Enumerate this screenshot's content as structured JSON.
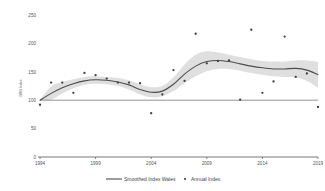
{
  "chart_data": {
    "type": "line",
    "title": "",
    "subtitle": "",
    "xlabel": "",
    "ylabel": "BRB Index",
    "xlim": [
      1994,
      2019
    ],
    "ylim": [
      0,
      250
    ],
    "grid": false,
    "legend_position": "bottom",
    "x_ticks": [
      "1994",
      "1999",
      "2004",
      "2009",
      "2014",
      "2019"
    ],
    "x_tick_values": [
      1994,
      1999,
      2004,
      2009,
      2014,
      2019
    ],
    "y_ticks": [
      "0",
      "50",
      "100",
      "150",
      "200",
      "250"
    ],
    "y_tick_values": [
      0,
      50,
      100,
      150,
      200,
      250
    ],
    "reference_line": {
      "label": "Baseline 100",
      "value": 100
    },
    "x": [
      1994,
      1995,
      1996,
      1997,
      1998,
      1999,
      2000,
      2001,
      2002,
      2003,
      2004,
      2005,
      2006,
      2007,
      2008,
      2009,
      2010,
      2011,
      2012,
      2013,
      2014,
      2015,
      2016,
      2017,
      2018,
      2019
    ],
    "series": [
      {
        "name": "Smoothed Index Wales",
        "type": "line",
        "color": "#4d4d4d",
        "values": [
          100,
          112,
          122,
          129,
          134,
          136,
          135,
          132,
          127,
          119,
          114,
          116,
          128,
          146,
          160,
          168,
          170,
          168,
          164,
          160,
          157,
          155,
          155,
          156,
          153,
          145
        ]
      },
      {
        "name": "Annual Index",
        "type": "scatter",
        "color": "#3f3f3f",
        "values": [
          92,
          131,
          131,
          113,
          148,
          144,
          138,
          131,
          131,
          130,
          77,
          110,
          153,
          134,
          217,
          165,
          169,
          170,
          101,
          224,
          113,
          133,
          212,
          141,
          147,
          88
        ]
      },
      {
        "name": "Confidence band upper",
        "type": "band-upper",
        "color": "#d9d9d9",
        "values": [
          100,
          124,
          132,
          137,
          141,
          142,
          141,
          139,
          135,
          128,
          123,
          125,
          140,
          163,
          180,
          186,
          184,
          180,
          176,
          172,
          169,
          168,
          168,
          170,
          170,
          168
        ]
      },
      {
        "name": "Confidence band lower",
        "type": "band-lower",
        "color": "#d9d9d9",
        "values": [
          100,
          101,
          112,
          121,
          127,
          129,
          128,
          125,
          119,
          110,
          105,
          107,
          116,
          130,
          142,
          151,
          155,
          155,
          152,
          148,
          145,
          142,
          141,
          140,
          134,
          122
        ]
      }
    ],
    "legend": [
      {
        "label": "Smoothed Index Wales",
        "marker": "line",
        "color": "#4d4d4d"
      },
      {
        "label": "Annual Index",
        "marker": "dot",
        "color": "#3f3f3f"
      }
    ]
  },
  "colors": {
    "band": "#d9d9d9",
    "line": "#4d4d4d",
    "point": "#3f3f3f",
    "axis": "#555555",
    "text": "#555555",
    "background": "#ffffff"
  }
}
